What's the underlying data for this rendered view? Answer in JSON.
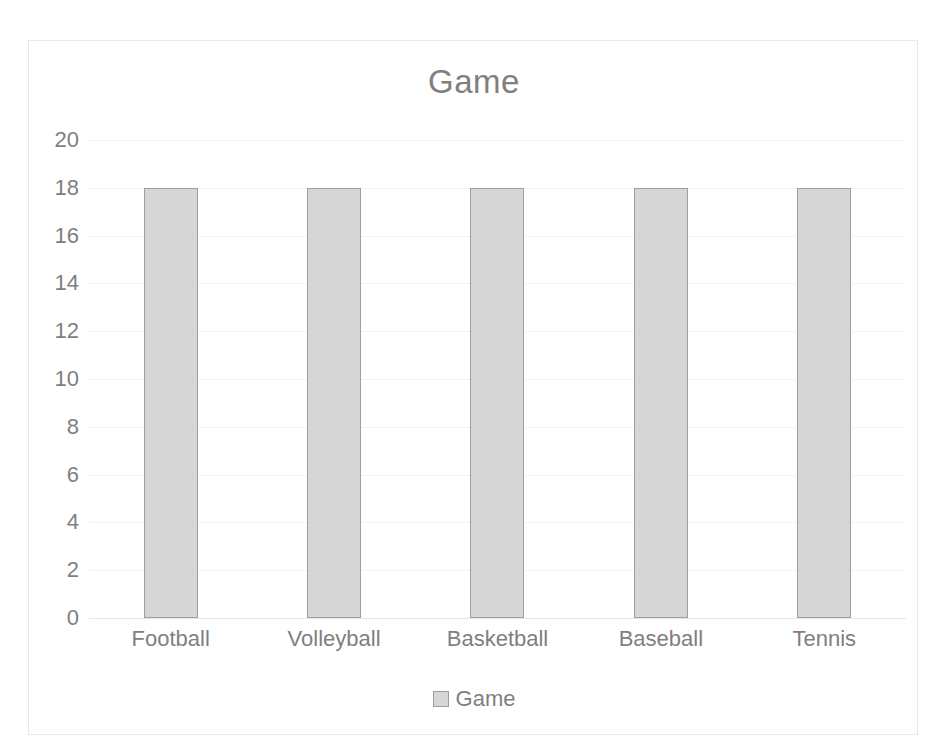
{
  "chart_data": {
    "type": "bar",
    "title": "Game",
    "xlabel": "",
    "ylabel": "",
    "categories": [
      "Football",
      "Volleyball",
      "Basketball",
      "Baseball",
      "Tennis"
    ],
    "series": [
      {
        "name": "Game",
        "values": [
          18,
          18,
          18,
          18,
          18
        ]
      }
    ],
    "values": [
      18,
      18,
      18,
      18,
      18
    ],
    "ylim": [
      0,
      20
    ],
    "y_ticks": [
      0,
      2,
      4,
      6,
      8,
      10,
      12,
      14,
      16,
      18,
      20
    ],
    "y_tick_labels": [
      "0",
      "2",
      "4",
      "6",
      "8",
      "10",
      "12",
      "14",
      "16",
      "18",
      "20"
    ],
    "grid": true,
    "grid_axis": "y",
    "legend": {
      "position": "bottom",
      "entries": [
        "Game"
      ]
    },
    "colors": {
      "bar_fill": "#d6d6d6",
      "bar_border": "#9e9e9e",
      "text": "#7f7f7f",
      "gridline": "#f2f2f2",
      "plot_border": "#e8e8e8",
      "background": "#ffffff"
    }
  }
}
